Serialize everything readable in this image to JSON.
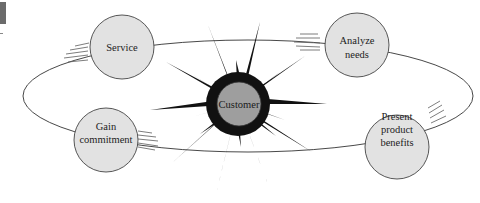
{
  "diagram": {
    "type": "cycle",
    "center": {
      "label": "Customer",
      "fill": "#9e9e9e",
      "burst_color": "#111111"
    },
    "orbit": {
      "stroke": "#333333"
    },
    "nodes": [
      {
        "id": "service",
        "lines": [
          "Service"
        ],
        "fill": "#e2e2e2"
      },
      {
        "id": "analyze-needs",
        "lines": [
          "Analyze",
          "needs"
        ],
        "fill": "#e2e2e2"
      },
      {
        "id": "present-product-benefits",
        "lines": [
          "Present",
          "product",
          "benefits"
        ],
        "fill": "#e2e2e2"
      },
      {
        "id": "gain-commitment",
        "lines": [
          "Gain",
          "commitment"
        ],
        "fill": "#e2e2e2"
      }
    ],
    "edge_mark": {
      "color": "#5c5c5c"
    }
  }
}
